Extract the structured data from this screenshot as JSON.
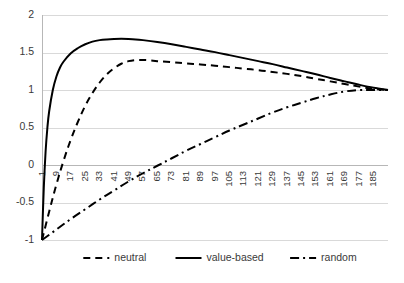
{
  "chart_data": {
    "type": "line",
    "title": "",
    "subtitle": "",
    "xlabel": "",
    "ylabel": "",
    "xlim": [
      1,
      193
    ],
    "ylim": [
      -1,
      2
    ],
    "grid": true,
    "grid_axis": "y",
    "legend_position": "bottom-center",
    "background": "#ffffff",
    "line_color": "#000000",
    "grid_color": "#d9d9d9",
    "axis_color": "#b7b7b7",
    "text_color": "#3a3a3a",
    "y_ticks": [
      "2",
      "1.5",
      "1",
      "0.5",
      "0",
      "-0.5",
      "-1"
    ],
    "y_tick_values": [
      2,
      1.5,
      1,
      0.5,
      0,
      -0.5,
      -1
    ],
    "x_ticks": [
      "1",
      "9",
      "17",
      "25",
      "33",
      "41",
      "49",
      "57",
      "65",
      "73",
      "81",
      "89",
      "97",
      "105",
      "113",
      "121",
      "129",
      "137",
      "145",
      "153",
      "161",
      "169",
      "177",
      "185"
    ],
    "x_tick_values": [
      1,
      9,
      17,
      25,
      33,
      41,
      49,
      57,
      65,
      73,
      81,
      89,
      97,
      105,
      113,
      121,
      129,
      137,
      145,
      153,
      161,
      169,
      177,
      185
    ],
    "x_tick_rotation": -90,
    "x_tick_step": 8,
    "x_axis_position": "zero",
    "series": [
      {
        "name": "neutral",
        "style": "dashed",
        "dash_pattern": "7,5",
        "stroke_width": 2.0,
        "x": [
          1,
          5,
          9,
          13,
          17,
          21,
          25,
          29,
          33,
          37,
          41,
          45,
          49,
          53,
          57,
          61,
          65,
          73,
          81,
          89,
          97,
          105,
          113,
          121,
          129,
          137,
          145,
          153,
          161,
          169,
          177,
          185,
          193
        ],
        "values": [
          -1.0,
          -0.62,
          -0.26,
          0.06,
          0.34,
          0.58,
          0.79,
          0.96,
          1.1,
          1.21,
          1.29,
          1.35,
          1.385,
          1.4,
          1.4,
          1.395,
          1.385,
          1.37,
          1.355,
          1.34,
          1.325,
          1.305,
          1.285,
          1.265,
          1.24,
          1.215,
          1.185,
          1.15,
          1.115,
          1.08,
          1.045,
          1.015,
          1.0
        ]
      },
      {
        "name": "value-based",
        "style": "solid",
        "dash_pattern": "",
        "stroke_width": 2.0,
        "x": [
          1,
          2,
          3,
          4,
          5,
          7,
          9,
          11,
          13,
          17,
          21,
          25,
          29,
          33,
          37,
          41,
          45,
          49,
          53,
          57,
          65,
          73,
          81,
          89,
          97,
          105,
          113,
          121,
          129,
          137,
          145,
          153,
          161,
          169,
          177,
          185,
          193
        ],
        "values": [
          -1.0,
          -0.3,
          0.18,
          0.5,
          0.72,
          1.0,
          1.18,
          1.3,
          1.38,
          1.49,
          1.56,
          1.61,
          1.645,
          1.665,
          1.675,
          1.68,
          1.682,
          1.68,
          1.675,
          1.665,
          1.64,
          1.61,
          1.575,
          1.54,
          1.505,
          1.465,
          1.425,
          1.385,
          1.345,
          1.3,
          1.255,
          1.21,
          1.16,
          1.115,
          1.07,
          1.03,
          1.0
        ]
      },
      {
        "name": "random",
        "style": "dash-dot",
        "dash_pattern": "9,4,2,4",
        "stroke_width": 2.0,
        "x": [
          1,
          9,
          17,
          25,
          33,
          41,
          49,
          57,
          65,
          73,
          81,
          89,
          97,
          105,
          113,
          121,
          129,
          137,
          145,
          153,
          161,
          169,
          177,
          185,
          193
        ],
        "values": [
          -1.0,
          -0.86,
          -0.72,
          -0.59,
          -0.46,
          -0.34,
          -0.22,
          -0.11,
          -0.01,
          0.09,
          0.19,
          0.28,
          0.37,
          0.46,
          0.54,
          0.62,
          0.7,
          0.77,
          0.83,
          0.89,
          0.94,
          0.98,
          1.0,
          1.0,
          1.0
        ]
      }
    ],
    "legend": [
      {
        "label": "neutral",
        "style": "dashed"
      },
      {
        "label": "value-based",
        "style": "solid"
      },
      {
        "label": "random",
        "style": "dash-dot"
      }
    ]
  }
}
